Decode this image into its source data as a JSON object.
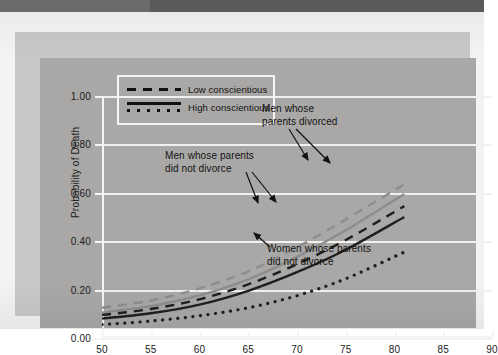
{
  "figure": {
    "background_outer": "#c9c8c6",
    "background_panel": "#a9a8a6",
    "grid_color": "#f2f1ef"
  },
  "axis_title_y": "Probability of Death",
  "legend": {
    "items": [
      {
        "label": "Low conscientious",
        "style": "dashed"
      },
      {
        "label": "High conscientious",
        "style": "solid-dotted"
      }
    ]
  },
  "annotations": [
    {
      "name": "men-parents-divorced",
      "text": "Men whose\nparents divorced"
    },
    {
      "name": "men-parents-did-not-divorce",
      "text": "Men whose parents\ndid not divorce"
    },
    {
      "name": "women-parents-did-not-divorce",
      "text": "Women whose parents\ndid not divorce"
    }
  ],
  "chart_data": {
    "type": "line",
    "title": "",
    "xlabel": "",
    "ylabel": "Probability of Death",
    "xlim": [
      50,
      90
    ],
    "ylim": [
      0.0,
      1.0
    ],
    "xticks": [
      50,
      55,
      60,
      65,
      70,
      75,
      80,
      85,
      90
    ],
    "yticks": [
      0.0,
      0.2,
      0.4,
      0.6,
      0.8,
      1.0
    ],
    "ytick_labels": [
      "0.00",
      "0.20",
      "0.40",
      "0.60",
      "0.80",
      "1.00"
    ],
    "xtick_labels": [
      "50",
      "55",
      "60",
      "65",
      "70",
      "75",
      "80",
      "85",
      "90"
    ],
    "grid": true,
    "legend_position": "upper-left",
    "x": [
      50,
      55,
      60,
      65,
      70,
      75,
      81
    ],
    "series": [
      {
        "name": "Men whose parents divorced — Low conscientious",
        "style": "dashed",
        "color": "#8e8d8b",
        "values": [
          0.125,
          0.155,
          0.205,
          0.275,
          0.375,
          0.49,
          0.635
        ]
      },
      {
        "name": "Men whose parents divorced — High conscientious",
        "style": "solid",
        "color": "#8e8d8b",
        "values": [
          0.105,
          0.132,
          0.176,
          0.242,
          0.335,
          0.445,
          0.595
        ]
      },
      {
        "name": "Men whose parents did not divorce — Low conscientious",
        "style": "dashed",
        "color": "#1f1f1f",
        "values": [
          0.095,
          0.12,
          0.16,
          0.222,
          0.305,
          0.405,
          0.545
        ]
      },
      {
        "name": "Men whose parents did not divorce — High conscientious",
        "style": "solid",
        "color": "#1f1f1f",
        "values": [
          0.08,
          0.102,
          0.138,
          0.195,
          0.272,
          0.365,
          0.5
        ]
      },
      {
        "name": "Women whose parents did not divorce",
        "style": "dotted",
        "color": "#1f1f1f",
        "values": [
          0.055,
          0.07,
          0.092,
          0.125,
          0.175,
          0.245,
          0.355
        ]
      }
    ]
  }
}
